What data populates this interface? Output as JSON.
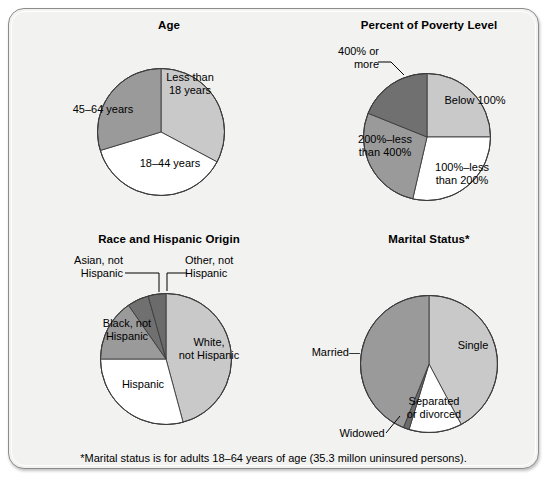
{
  "figure": {
    "footnote": "*Marital status is for adults 18–64 years of age (35.3 millon uninsured persons).",
    "background_color": "#f2f2f0",
    "border_color": "#8c8c8c"
  },
  "palette": {
    "light_gray": "#c9c9c9",
    "medium_gray": "#9a9a9a",
    "dark_gray": "#808080",
    "darker_gray": "#707070",
    "white": "#ffffff",
    "outline": "#3c3c3c"
  },
  "chart_data": [
    {
      "id": "age",
      "type": "pie",
      "title": "Age",
      "start_angle_deg": 0,
      "direction": "clockwise",
      "categories": [
        "Less than 18 years",
        "18–44 years",
        "45–64 years"
      ],
      "values": [
        32.8,
        37.5,
        29.7
      ],
      "labels": [
        "Less than\n18 years",
        "18–44 years",
        "45–64 years"
      ],
      "colors": [
        "#c9c9c9",
        "#ffffff",
        "#9a9a9a"
      ],
      "legend": "none"
    },
    {
      "id": "poverty",
      "type": "pie",
      "title": "Percent of Poverty Level",
      "start_angle_deg": 0,
      "direction": "clockwise",
      "categories": [
        "Below 100%",
        "100%–less than 200%",
        "200%–less than 400%",
        "400% or more"
      ],
      "values": [
        25.0,
        28.6,
        27.5,
        18.9
      ],
      "labels": [
        "Below 100%",
        "100%–less\nthan 200%",
        "200%–less\nthan 400%",
        "400% or\nmore"
      ],
      "colors": [
        "#c9c9c9",
        "#ffffff",
        "#9a9a9a",
        "#707070"
      ],
      "legend": "none"
    },
    {
      "id": "race",
      "type": "pie",
      "title": "Race and Hispanic Origin",
      "start_angle_deg": 0,
      "direction": "clockwise",
      "categories": [
        "White, not Hispanic",
        "Hispanic",
        "Black, not Hispanic",
        "Asian, not Hispanic",
        "Other, not Hispanic"
      ],
      "values": [
        45.8,
        29.2,
        15.3,
        5.3,
        4.4
      ],
      "labels": [
        "White,\nnot Hispanic",
        "Hispanic",
        "Black, not\nHispanic",
        "Asian, not\nHispanic",
        "Other, not\nHispanic"
      ],
      "colors": [
        "#c9c9c9",
        "#ffffff",
        "#9a9a9a",
        "#707070",
        "#6b6b6b"
      ],
      "legend": "none"
    },
    {
      "id": "marital",
      "type": "pie",
      "title": "Marital Status*",
      "start_angle_deg": 0,
      "direction": "clockwise",
      "categories": [
        "Single",
        "Separated or divorced",
        "Widowed",
        "Married"
      ],
      "values": [
        42.2,
        12.5,
        1.4,
        43.9
      ],
      "labels": [
        "Single",
        "Separated\nor divorced",
        "Widowed",
        "Married—"
      ],
      "colors": [
        "#c9c9c9",
        "#ffffff",
        "#6b6b6b",
        "#9a9a9a"
      ],
      "legend": "none"
    }
  ]
}
